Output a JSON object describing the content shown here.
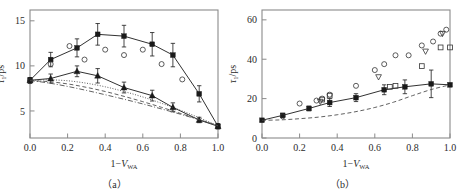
{
  "figure": {
    "background": "#ffffff",
    "axis_color": "#8a8a8a",
    "marker_color": "#1a1a1a",
    "panels": [
      "a",
      "b"
    ]
  },
  "panel_a": {
    "caption": "（a）",
    "ylabel_tau": "τ",
    "ylabel_sub": "1",
    "ylabel_unit": "/ps",
    "xlabel_main": "1−V",
    "xlabel_sub": "WA",
    "y_ticks": [
      "5",
      "10",
      "15"
    ],
    "x_ticks": [
      "0.0",
      "0.2",
      "0.4",
      "0.6",
      "0.8",
      "1.0"
    ]
  },
  "panel_b": {
    "caption": "（b）",
    "ylabel_tau": "τ",
    "ylabel_sub": "1",
    "ylabel_unit": "/ps",
    "xlabel_main": "1−V",
    "xlabel_sub": "WA",
    "y_ticks": [
      "0",
      "20",
      "40",
      "60"
    ],
    "x_ticks": [
      "0.0",
      "0.2",
      "0.4",
      "0.6",
      "0.8",
      "1.0"
    ]
  },
  "chart_data": [
    {
      "type": "scatter",
      "panel": "a",
      "title": "",
      "xlabel": "1-V_WA",
      "ylabel": "tau_1 / ps",
      "xlim": [
        0.0,
        1.0
      ],
      "ylim": [
        2.0,
        16.2
      ],
      "xticks": [
        0.0,
        0.2,
        0.4,
        0.6,
        0.8,
        1.0
      ],
      "yticks": [
        5,
        10,
        15
      ],
      "grid": false,
      "legend": null,
      "series": [
        {
          "name": "upper-filled-square",
          "marker": "filled-square",
          "line": "solid",
          "errorbars": true,
          "x": [
            0.0,
            0.11,
            0.25,
            0.36,
            0.5,
            0.65,
            0.76,
            0.9,
            1.0
          ],
          "y": [
            8.4,
            10.7,
            12.0,
            13.5,
            13.3,
            12.4,
            11.2,
            6.9,
            3.3
          ],
          "yerr": [
            0.3,
            0.8,
            1.0,
            1.2,
            1.2,
            1.3,
            1.3,
            0.9,
            0.3
          ]
        },
        {
          "name": "lower-filled-triangle",
          "marker": "filled-triangle",
          "line": "solid",
          "errorbars": true,
          "x": [
            0.0,
            0.11,
            0.25,
            0.36,
            0.5,
            0.65,
            0.76,
            0.9,
            1.0
          ],
          "y": [
            8.4,
            8.6,
            9.4,
            8.9,
            7.6,
            6.7,
            5.4,
            4.0,
            3.3
          ],
          "yerr": [
            0.3,
            0.5,
            0.6,
            0.8,
            0.6,
            0.6,
            0.5,
            0.3,
            0.2
          ]
        },
        {
          "name": "open-circle",
          "marker": "open-circle",
          "line": "none",
          "errorbars": false,
          "x": [
            0.0,
            0.11,
            0.21,
            0.29,
            0.4,
            0.5,
            0.6,
            0.7,
            0.81
          ],
          "y": [
            8.3,
            10.2,
            12.2,
            10.7,
            11.8,
            11.2,
            11.8,
            10.2,
            8.5
          ]
        },
        {
          "name": "theory-dashed",
          "marker": "none",
          "line": "dashed",
          "errorbars": false,
          "x": [
            0.0,
            0.1,
            0.2,
            0.3,
            0.4,
            0.5,
            0.6,
            0.7,
            0.8,
            0.9,
            1.0
          ],
          "y": [
            8.35,
            8.25,
            8.0,
            7.62,
            7.16,
            6.62,
            6.03,
            5.4,
            4.73,
            4.05,
            3.35
          ]
        },
        {
          "name": "theory-dotted",
          "marker": "none",
          "line": "dotted",
          "errorbars": false,
          "x": [
            0.0,
            0.1,
            0.2,
            0.3,
            0.4,
            0.5,
            0.6,
            0.7,
            0.8,
            0.9,
            1.0
          ],
          "y": [
            8.4,
            8.45,
            8.35,
            8.08,
            7.68,
            7.16,
            6.55,
            5.85,
            5.08,
            4.25,
            3.35
          ]
        },
        {
          "name": "theory-dashdot",
          "marker": "none",
          "line": "dashdot",
          "errorbars": false,
          "x": [
            0.0,
            0.1,
            0.2,
            0.3,
            0.4,
            0.5,
            0.6,
            0.7,
            0.8,
            0.9,
            1.0
          ],
          "y": [
            8.38,
            8.1,
            7.72,
            7.28,
            6.8,
            6.3,
            5.78,
            5.22,
            4.64,
            4.02,
            3.35
          ]
        }
      ]
    },
    {
      "type": "scatter",
      "panel": "b",
      "title": "",
      "xlabel": "1-V_WA",
      "ylabel": "tau_1 / ps",
      "xlim": [
        0.0,
        1.0
      ],
      "ylim": [
        0.0,
        65.0
      ],
      "xticks": [
        0.0,
        0.2,
        0.4,
        0.6,
        0.8,
        1.0
      ],
      "yticks": [
        0,
        20,
        40,
        60
      ],
      "grid": false,
      "legend": null,
      "series": [
        {
          "name": "filled-square",
          "marker": "filled-square",
          "line": "solid",
          "errorbars": true,
          "x": [
            0.0,
            0.11,
            0.25,
            0.36,
            0.5,
            0.65,
            0.76,
            0.9,
            1.0
          ],
          "y": [
            9.0,
            11.5,
            15.0,
            18.0,
            20.5,
            24.5,
            26.0,
            27.5,
            27.0
          ],
          "yerr": [
            0.6,
            1.0,
            1.2,
            2.0,
            2.0,
            2.5,
            3.5,
            7.0,
            0.8
          ]
        },
        {
          "name": "open-circle",
          "marker": "open-circle",
          "line": "none",
          "errorbars": false,
          "x": [
            0.11,
            0.2,
            0.29,
            0.32,
            0.36,
            0.5,
            0.6,
            0.65,
            0.71,
            0.78,
            0.85,
            0.91,
            0.95,
            0.98
          ],
          "y": [
            11.0,
            17.5,
            19.0,
            20.0,
            22.0,
            26.5,
            34.5,
            37.5,
            42.0,
            42.0,
            47.0,
            49.0,
            53.0,
            55.0
          ]
        },
        {
          "name": "open-square",
          "marker": "open-square",
          "line": "none",
          "errorbars": false,
          "x": [
            0.32,
            0.36,
            0.68,
            0.71,
            0.85,
            0.95,
            1.0
          ],
          "y": [
            19.5,
            21.5,
            26.0,
            26.5,
            36.5,
            46.0,
            46.0
          ]
        },
        {
          "name": "open-triangle-down",
          "marker": "open-triangle-down",
          "line": "none",
          "errorbars": false,
          "x": [
            0.31,
            0.62,
            0.87,
            0.96
          ],
          "y": [
            18.5,
            31.0,
            44.0,
            53.0
          ]
        },
        {
          "name": "theory-dashed",
          "marker": "none",
          "line": "dashed",
          "errorbars": false,
          "x": [
            0.0,
            0.1,
            0.2,
            0.3,
            0.4,
            0.5,
            0.6,
            0.7,
            0.8,
            0.9,
            1.0
          ],
          "y": [
            9.0,
            9.2,
            9.8,
            10.6,
            11.8,
            13.4,
            15.5,
            18.2,
            21.5,
            24.6,
            27.0
          ]
        }
      ]
    }
  ]
}
